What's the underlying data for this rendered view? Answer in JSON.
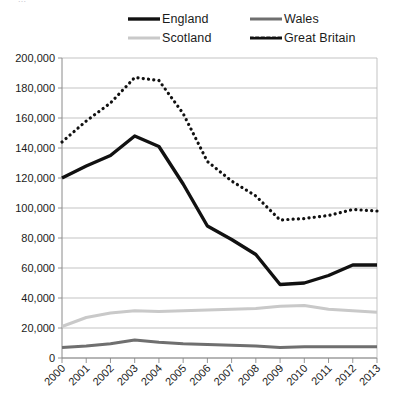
{
  "page": {
    "cropped_header_text": "..."
  },
  "legend": {
    "position": "top",
    "entries": [
      {
        "label": "England",
        "color": "#111111",
        "style": "solid",
        "width": 3.4
      },
      {
        "label": "Wales",
        "color": "#6f6f6f",
        "style": "solid",
        "width": 3.0
      },
      {
        "label": "Scotland",
        "color": "#c9c9c9",
        "style": "solid",
        "width": 3.0
      },
      {
        "label": "Great Britain",
        "color": "#111111",
        "style": "dotted",
        "width": 3.2
      }
    ]
  },
  "chart_data": {
    "type": "line",
    "title": "",
    "subtitle": "",
    "xlabel": "",
    "ylabel": "",
    "grid": true,
    "legend_position": "top",
    "x": [
      "2000",
      "2001",
      "2002",
      "2003",
      "2004",
      "2005",
      "2006",
      "2007",
      "2008",
      "2009",
      "2010",
      "2011",
      "2012",
      "2013"
    ],
    "categories": [
      "2000",
      "2001",
      "2002",
      "2003",
      "2004",
      "2005",
      "2006",
      "2007",
      "2008",
      "2009",
      "2010",
      "2011",
      "2012",
      "2013"
    ],
    "ylim": [
      0,
      200000
    ],
    "ytick_step": 20000,
    "ytick_labels": [
      "0",
      "20,000",
      "40,000",
      "60,000",
      "80,000",
      "100,000",
      "120,000",
      "140,000",
      "160,000",
      "180,000",
      "200,000"
    ],
    "series": [
      {
        "name": "England",
        "color": "#111111",
        "style": "solid",
        "width": 3.4,
        "values": [
          120000,
          128000,
          135000,
          148000,
          141000,
          116000,
          88000,
          79000,
          69000,
          49000,
          50000,
          55000,
          62000,
          62000
        ]
      },
      {
        "name": "Wales",
        "color": "#6f6f6f",
        "style": "solid",
        "width": 3.0,
        "values": [
          7000,
          8000,
          9500,
          12000,
          10500,
          9500,
          9000,
          8500,
          8000,
          7000,
          7500,
          7500,
          7500,
          7500
        ]
      },
      {
        "name": "Scotland",
        "color": "#c9c9c9",
        "style": "solid",
        "width": 3.0,
        "values": [
          21000,
          27000,
          30000,
          31500,
          31000,
          31500,
          32000,
          32500,
          33000,
          34500,
          35000,
          32500,
          31500,
          30500
        ]
      },
      {
        "name": "Great Britain",
        "color": "#111111",
        "style": "dotted",
        "width": 3.2,
        "values": [
          144000,
          158000,
          170000,
          187000,
          185000,
          163000,
          131000,
          118000,
          108000,
          92000,
          93000,
          95000,
          99000,
          98000
        ]
      }
    ]
  }
}
